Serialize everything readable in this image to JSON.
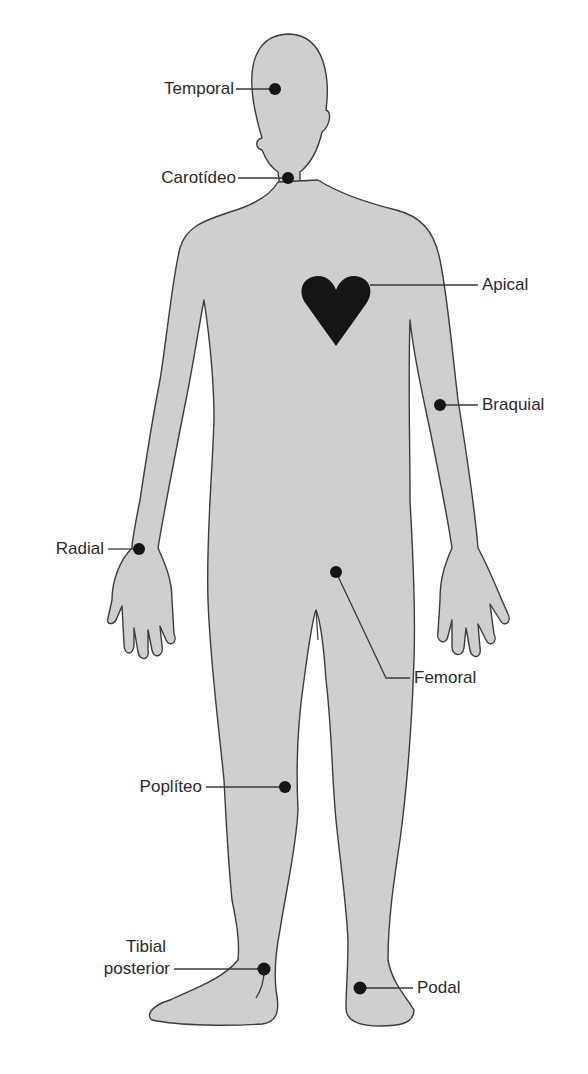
{
  "diagram": {
    "colors": {
      "body_fill": "#cfcfcf",
      "body_stroke": "#3c3c3c",
      "marker": "#151515",
      "leader": "#3a3a3a",
      "text": "#2a2a2a"
    },
    "labels": {
      "temporal": "Temporal",
      "carotideo": "Carotídeo",
      "apical": "Apical",
      "braquial": "Braquial",
      "radial": "Radial",
      "femoral": "Femoral",
      "popliteo": "Poplíteo",
      "tibial_line1": "Tibial",
      "tibial_line2": "posterior",
      "podal": "Podal"
    }
  }
}
